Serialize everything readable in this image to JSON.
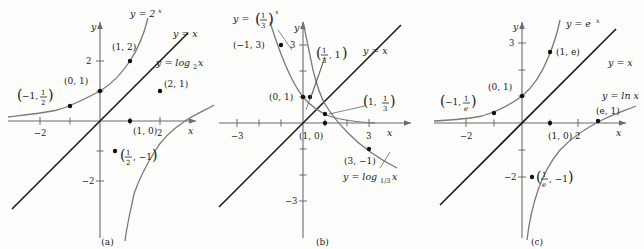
{
  "figure": {
    "panels": [
      {
        "id": "a",
        "caption": "(a)",
        "axis_label_x": "x",
        "axis_label_y": "y",
        "x_ticks": [
          {
            "value": -2,
            "label": "−2"
          },
          {
            "value": -1,
            "label": ""
          },
          {
            "value": 1,
            "label": ""
          },
          {
            "value": 2,
            "label": "2"
          }
        ],
        "y_ticks": [
          {
            "value": 2,
            "label": "2"
          },
          {
            "value": 1,
            "label": ""
          },
          {
            "value": -1,
            "label": ""
          },
          {
            "value": -2,
            "label": "−2"
          }
        ],
        "curves": [
          {
            "name": "exponential",
            "label": "y = 2",
            "label_exp": "x",
            "equation": "y = 2^x"
          },
          {
            "name": "identity",
            "label": "y = x",
            "equation": "y = x"
          },
          {
            "name": "logarithm",
            "label": "y = log",
            "label_sub": "2",
            "label_arg": "x",
            "equation": "y = log_2 x"
          }
        ],
        "points": [
          {
            "label_text": "(1, 2)",
            "x": 1,
            "y": 2,
            "on": "exponential"
          },
          {
            "label_text": "(0, 1)",
            "x": 0,
            "y": 1,
            "on": "exponential"
          },
          {
            "label_frac": true,
            "label_lead": "−1,",
            "label_num": "1",
            "label_den": "2",
            "x": -1,
            "y": 0.5,
            "on": "exponential"
          },
          {
            "label_text": "(2, 1)",
            "x": 2,
            "y": 1,
            "on": "logarithm"
          },
          {
            "label_text": "(1, 0)",
            "x": 1,
            "y": 0,
            "on": "logarithm"
          },
          {
            "label_frac": true,
            "label_num": "1",
            "label_den": "2",
            "label_tail": ", −1",
            "x": 0.5,
            "y": -1,
            "on": "logarithm"
          }
        ]
      },
      {
        "id": "b",
        "caption": "(b)",
        "axis_label_x": "x",
        "axis_label_y": "y",
        "x_ticks": [
          {
            "value": -3,
            "label": "−3"
          },
          {
            "value": -2,
            "label": ""
          },
          {
            "value": -1,
            "label": ""
          },
          {
            "value": 1,
            "label": ""
          },
          {
            "value": 2,
            "label": ""
          },
          {
            "value": 3,
            "label": "3"
          }
        ],
        "y_ticks": [
          {
            "value": 3,
            "label": "3"
          },
          {
            "value": 2,
            "label": ""
          },
          {
            "value": 1,
            "label": ""
          },
          {
            "value": -1,
            "label": ""
          },
          {
            "value": -2,
            "label": ""
          },
          {
            "value": -3,
            "label": "−3"
          }
        ],
        "curves": [
          {
            "name": "exponential",
            "label": "y =",
            "label_num": "1",
            "label_den": "3",
            "label_exp": "x",
            "equation": "y = (1/3)^x"
          },
          {
            "name": "identity",
            "label": "y = x",
            "equation": "y = x"
          },
          {
            "name": "logarithm",
            "label": "y = log",
            "label_sub": "1/3",
            "label_arg": "x",
            "equation": "y = log_(1/3) x"
          }
        ],
        "points": [
          {
            "label_text": "(−1, 3)",
            "x": -1,
            "y": 3,
            "on": "exponential"
          },
          {
            "label_text": "(0, 1)",
            "x": 0,
            "y": 1,
            "on": "exponential"
          },
          {
            "label_frac": true,
            "label_num": "1",
            "label_den": "3",
            "label_tail": ", 1",
            "x": 0.3333,
            "y": 1,
            "on": "exponential"
          },
          {
            "label_frac": true,
            "label_lead": "1,",
            "label_num": "1",
            "label_den": "3",
            "x": 1,
            "y": 0.3333,
            "on": "logarithm"
          },
          {
            "label_text": "(1, 0)",
            "x": 1,
            "y": 0,
            "on": "logarithm"
          },
          {
            "label_text": "(3, −1)",
            "x": 3,
            "y": -1,
            "on": "logarithm"
          }
        ]
      },
      {
        "id": "c",
        "caption": "(c)",
        "axis_label_x": "x",
        "axis_label_y": "y",
        "x_ticks": [
          {
            "value": -2,
            "label": "−2"
          },
          {
            "value": -1,
            "label": ""
          },
          {
            "value": 1,
            "label": ""
          },
          {
            "value": 2,
            "label": "2"
          }
        ],
        "y_ticks": [
          {
            "value": 3,
            "label": "3"
          },
          {
            "value": 2,
            "label": ""
          },
          {
            "value": 1,
            "label": ""
          },
          {
            "value": -1,
            "label": ""
          },
          {
            "value": -2,
            "label": "−2"
          }
        ],
        "curves": [
          {
            "name": "exponential",
            "label": "y = e",
            "label_exp": "x",
            "equation": "y = e^x"
          },
          {
            "name": "identity",
            "label": "y = x",
            "equation": "y = x"
          },
          {
            "name": "logarithm",
            "label": "y = ln x",
            "equation": "y = ln x"
          }
        ],
        "points": [
          {
            "label_text": "(1, e)",
            "x": 1,
            "y": 2.718,
            "on": "exponential"
          },
          {
            "label_text": "(0, 1)",
            "x": 0,
            "y": 1,
            "on": "exponential"
          },
          {
            "label_frac": true,
            "label_lead": "−1,",
            "label_num": "1",
            "label_den": "e",
            "x": -1,
            "y": 0.368,
            "on": "exponential"
          },
          {
            "label_text": "(e, 1)",
            "x": 2.718,
            "y": 1,
            "on": "logarithm"
          },
          {
            "label_text": "(1, 0)",
            "x": 1,
            "y": 0,
            "on": "logarithm"
          },
          {
            "label_frac": true,
            "label_num": "1",
            "label_den": "e",
            "label_tail": ", −1",
            "x": 0.368,
            "y": -1,
            "on": "logarithm"
          }
        ]
      }
    ],
    "colors": {
      "axis": "#6b6b6b",
      "curve": "#7a7a7a",
      "identity_line": "#1a1a1a",
      "point": "#111111",
      "text": "#1a1a1a",
      "background": "#fdfdfb"
    }
  }
}
